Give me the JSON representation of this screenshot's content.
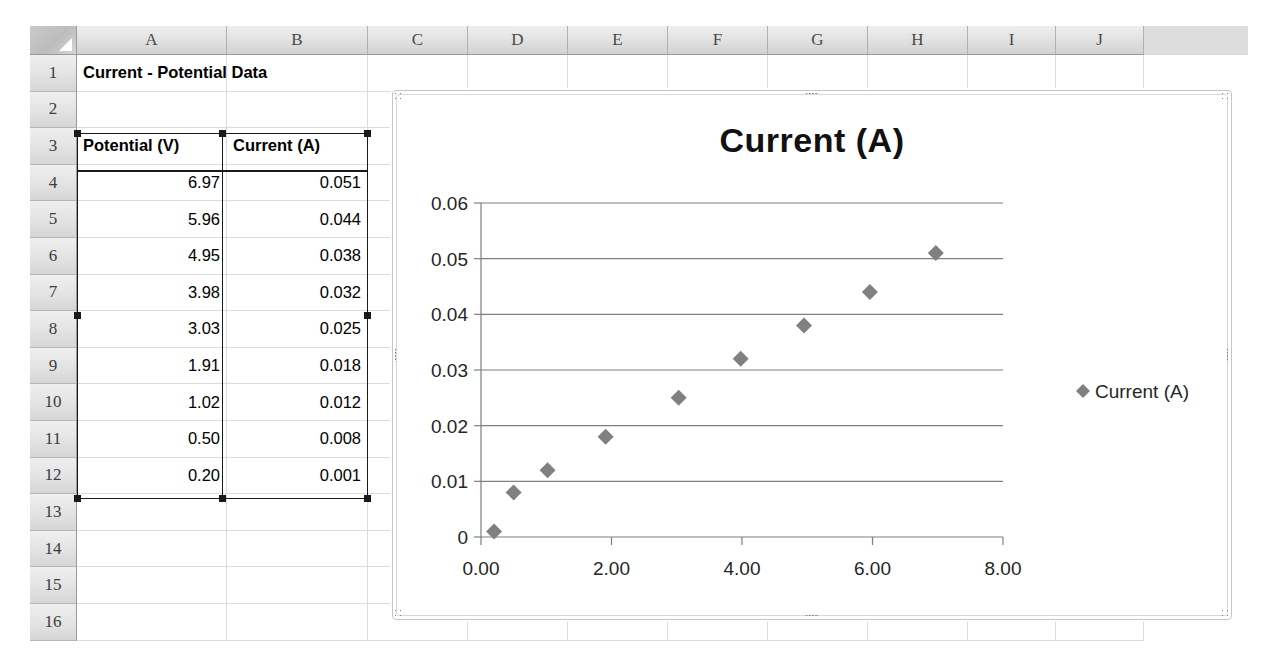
{
  "spreadsheet": {
    "columns": [
      "A",
      "B",
      "C",
      "D",
      "E",
      "F",
      "G",
      "H",
      "I",
      "J"
    ],
    "rows": [
      "1",
      "2",
      "3",
      "4",
      "5",
      "6",
      "7",
      "8",
      "9",
      "10",
      "11",
      "12",
      "13",
      "14",
      "15",
      "16"
    ],
    "title_cell": "Current - Potential Data",
    "headers": {
      "potential": "Potential (V)",
      "current": "Current (A)"
    },
    "data_rows": [
      {
        "row": "4",
        "potential": "6.97",
        "current": "0.051"
      },
      {
        "row": "5",
        "potential": "5.96",
        "current": "0.044"
      },
      {
        "row": "6",
        "potential": "4.95",
        "current": "0.038"
      },
      {
        "row": "7",
        "potential": "3.98",
        "current": "0.032"
      },
      {
        "row": "8",
        "potential": "3.03",
        "current": "0.025"
      },
      {
        "row": "9",
        "potential": "1.91",
        "current": "0.018"
      },
      {
        "row": "10",
        "potential": "1.02",
        "current": "0.012"
      },
      {
        "row": "11",
        "potential": "0.50",
        "current": "0.008"
      },
      {
        "row": "12",
        "potential": "0.20",
        "current": "0.001"
      }
    ],
    "selection_range": "A3:B12"
  },
  "chart_data": {
    "type": "scatter",
    "title": "Current (A)",
    "xlabel": "",
    "ylabel": "",
    "xlim": [
      0,
      8
    ],
    "ylim": [
      0,
      0.06
    ],
    "grid": true,
    "legend_position": "right",
    "marker": "diamond",
    "marker_color": "#808080",
    "xticks": [
      "0.00",
      "2.00",
      "4.00",
      "6.00",
      "8.00"
    ],
    "xtick_values": [
      0,
      2,
      4,
      6,
      8
    ],
    "yticks": [
      "0",
      "0.01",
      "0.02",
      "0.03",
      "0.04",
      "0.05",
      "0.06"
    ],
    "ytick_values": [
      0,
      0.01,
      0.02,
      0.03,
      0.04,
      0.05,
      0.06
    ],
    "series": [
      {
        "name": "Current (A)",
        "x": [
          6.97,
          5.96,
          4.95,
          3.98,
          3.03,
          1.91,
          1.02,
          0.5,
          0.2
        ],
        "values": [
          0.051,
          0.044,
          0.038,
          0.032,
          0.025,
          0.018,
          0.012,
          0.008,
          0.001
        ]
      }
    ],
    "legend": [
      "Current (A)"
    ]
  }
}
